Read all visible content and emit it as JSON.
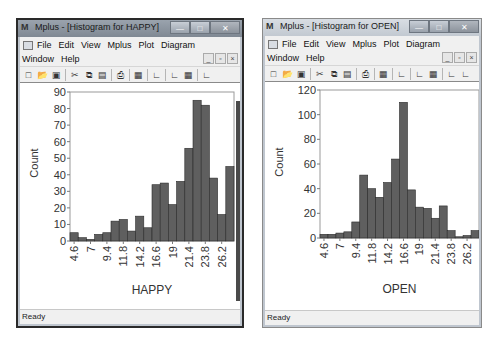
{
  "windows": [
    {
      "title": "Mplus - [Histogram for HAPPY]",
      "app_icon": "M",
      "menu_row1": [
        "File",
        "Edit",
        "View",
        "Mplus",
        "Plot",
        "Diagram"
      ],
      "menu_row2": [
        "Window",
        "Help"
      ],
      "window_buttons": {
        "minimize": "—",
        "maximize": "□",
        "close": "✕"
      },
      "mdi_buttons": {
        "minimize": "_",
        "restore": "▫",
        "close": "×"
      },
      "status": "Ready"
    },
    {
      "title": "Mplus - [Histogram for OPEN]",
      "app_icon": "M",
      "menu_row1": [
        "File",
        "Edit",
        "View",
        "Mplus",
        "Plot",
        "Diagram"
      ],
      "menu_row2": [
        "Window",
        "Help"
      ],
      "window_buttons": {
        "minimize": "—",
        "maximize": "□",
        "close": "✕"
      },
      "mdi_buttons": {
        "minimize": "_",
        "restore": "▫",
        "close": "×"
      },
      "status": "Ready"
    }
  ],
  "toolbar_icons": [
    "new-icon",
    "open-icon",
    "save-icon",
    "cut-icon",
    "copy-icon",
    "paste-icon",
    "print-icon",
    "table-icon",
    "chart-icon",
    "chart-2-icon",
    "chart-3-icon",
    "chart-4-icon",
    "chart-5-icon"
  ],
  "colors": {
    "bar_fill": "#5f5f5f",
    "bar_edge": "#2b2b2b",
    "axis": "#7a7a7a"
  },
  "chart_data": [
    {
      "type": "bar",
      "title": "Histogram for HAPPY",
      "xlabel": "HAPPY",
      "ylabel": "Count",
      "ylim": [
        0,
        90
      ],
      "yticks": [
        0,
        10,
        20,
        30,
        40,
        50,
        60,
        70,
        80,
        90
      ],
      "xtick_labels": [
        "4.6",
        "7",
        "9.4",
        "11.8",
        "14.2",
        "16.6",
        "19",
        "21.4",
        "23.8",
        "26.2"
      ],
      "values": [
        5,
        2,
        1,
        4,
        5,
        12,
        13,
        6,
        15,
        8,
        34,
        35,
        22,
        36,
        56,
        85,
        82,
        38,
        16,
        45
      ],
      "grid": false
    },
    {
      "type": "bar",
      "title": "Histogram for OPEN",
      "xlabel": "OPEN",
      "ylabel": "Count",
      "ylim": [
        0,
        120
      ],
      "yticks": [
        0,
        20,
        40,
        60,
        80,
        100,
        120
      ],
      "xtick_labels": [
        "4.6",
        "7",
        "9.4",
        "11.8",
        "14.2",
        "16.6",
        "19",
        "21.4",
        "23.8",
        "26.2"
      ],
      "values": [
        3,
        3,
        4,
        5,
        13,
        51,
        40,
        33,
        45,
        64,
        110,
        39,
        25,
        24,
        16,
        26,
        6,
        1,
        2,
        6
      ],
      "grid": false
    }
  ]
}
